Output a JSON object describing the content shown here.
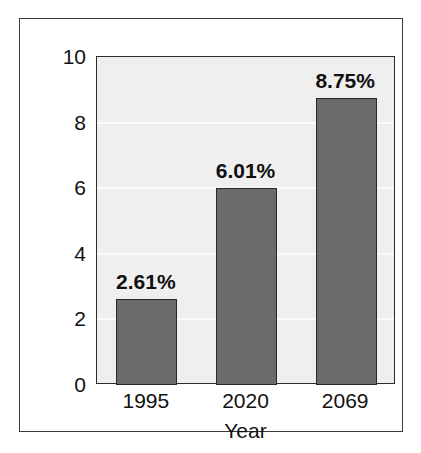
{
  "chart_data": {
    "type": "bar",
    "title": "",
    "subtitle": "",
    "xlabel": "Year",
    "ylabel": "",
    "categories": [
      "1995",
      "2020",
      "2069"
    ],
    "values": [
      2.61,
      6.01,
      8.75
    ],
    "data_labels": [
      "2.61%",
      "6.01%",
      "8.75%"
    ],
    "ylim": [
      0,
      10
    ],
    "y_ticks": [
      0,
      2,
      4,
      6,
      8,
      10
    ],
    "y_tick_labels": [
      "0",
      "2",
      "4",
      "6",
      "8",
      "10"
    ],
    "grid": true,
    "grid_axis": "y",
    "legend": false,
    "legend_position": "none",
    "series": [
      {
        "name": "",
        "values": [
          2.61,
          6.01,
          8.75
        ]
      }
    ],
    "colors": {
      "bar_fill": "#6b6b6b",
      "bar_edge": "#23292b",
      "plot_background": "#efefef",
      "gridline": "#fbfbfb",
      "axis_line": "#2b2b2b",
      "frame": "#3a3a3a",
      "text": "#111111",
      "figure_background": "#ffffff"
    }
  }
}
